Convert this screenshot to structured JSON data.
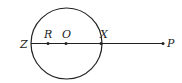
{
  "diagram": {
    "type": "geometry",
    "circle": {
      "cx": 66.5,
      "cy": 43.5,
      "r": 35.5,
      "center_label": "O"
    },
    "line": {
      "x1": 31,
      "y1": 43.5,
      "x2": 163,
      "y2": 43.5
    },
    "points": [
      {
        "label": "Z",
        "x": 31,
        "y": 43.5,
        "label_x": 20,
        "label_y": 48,
        "dot": false
      },
      {
        "label": "R",
        "x": 48,
        "y": 43.5,
        "label_x": 45,
        "label_y": 38,
        "dot": true
      },
      {
        "label": "O",
        "x": 66,
        "y": 43.5,
        "label_x": 63,
        "label_y": 38,
        "dot": true
      },
      {
        "label": "X",
        "x": 101,
        "y": 43.5,
        "label_x": 100,
        "label_y": 38,
        "dot": true
      },
      {
        "label": "P",
        "x": 163,
        "y": 43.5,
        "label_x": 167,
        "label_y": 47,
        "dot": true
      }
    ],
    "stroke_color": "#222222"
  }
}
